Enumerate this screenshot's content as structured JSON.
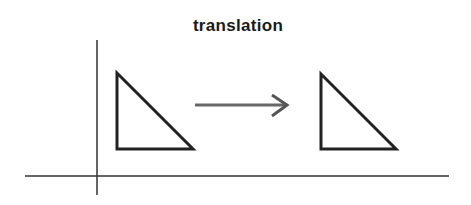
{
  "diagram": {
    "title": "translation",
    "colors": {
      "background": "#ffffff",
      "axis": "#333333",
      "triangle": "#222222",
      "arrow": "#666666"
    },
    "axes": {
      "vertical": {
        "x": 97,
        "y1": 40,
        "y2": 195
      },
      "horizontal": {
        "y": 176,
        "x1": 25,
        "x2": 449
      }
    },
    "shapes": [
      {
        "name": "original-triangle",
        "points": "117,73 117,149 193,149"
      },
      {
        "name": "translated-triangle",
        "points": "321,74 321,149 396,149"
      }
    ],
    "arrow": {
      "x1": 195,
      "y1": 105,
      "x2": 286,
      "y2": 105,
      "head": "272,95 287,105 272,116"
    }
  }
}
